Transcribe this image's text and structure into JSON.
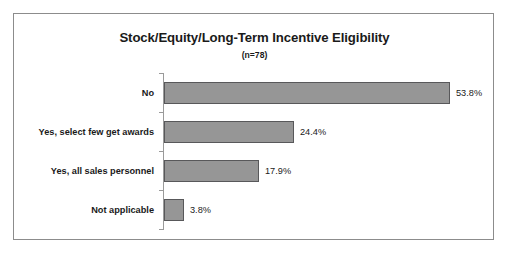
{
  "chart_data": {
    "type": "bar",
    "orientation": "horizontal",
    "title": "Stock/Equity/Long-Term Incentive Eligibility",
    "subtitle": "(n=78)",
    "xlabel": "",
    "ylabel": "",
    "categories": [
      "No",
      "Yes, select few get awards",
      "Yes, all sales personnel",
      "Not applicable"
    ],
    "values": [
      53.8,
      24.4,
      17.9,
      3.8
    ],
    "value_labels": [
      "53.8%",
      "24.4%",
      "17.9%",
      "3.8%"
    ],
    "xlim": [
      0,
      60
    ],
    "grid": false,
    "legend": null,
    "sample_size": 78,
    "bar_fill_color": "#969696",
    "bar_border_color": "#58585a",
    "axis_color": "#9a9a9a",
    "frame_color": "#8c8c8c",
    "background_color": "#ffffff",
    "text_color": "#1a1a1a"
  }
}
